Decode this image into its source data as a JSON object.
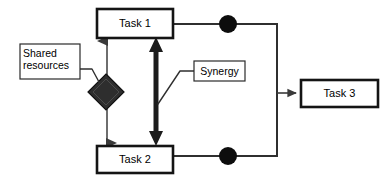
{
  "diagram": {
    "type": "block-flow-diagram",
    "canvas": {
      "width": 392,
      "height": 183,
      "background": "#ffffff"
    },
    "stroke_color": "#000000",
    "fill_color": "#ffffff",
    "shape_fill_dark": "#2b2b2b",
    "nodes": {
      "task1": {
        "label": "Task 1",
        "shape": "rectangle",
        "x": 97,
        "y": 9,
        "w": 76,
        "h": 29
      },
      "task2": {
        "label": "Task 2",
        "shape": "rectangle",
        "x": 97,
        "y": 146,
        "w": 76,
        "h": 27
      },
      "task3": {
        "label": "Task 3",
        "shape": "rectangle",
        "x": 301,
        "y": 80,
        "w": 77,
        "h": 27
      },
      "shared_resources": {
        "label": "Shared\nresources",
        "line1": "Shared",
        "line2": "resources",
        "shape": "rectangle",
        "x": 20,
        "y": 44,
        "w": 60,
        "h": 35
      },
      "synergy": {
        "label": "Synergy",
        "shape": "rectangle",
        "x": 194,
        "y": 61,
        "w": 51,
        "h": 20
      },
      "diamond": {
        "label": "",
        "shape": "diamond-filled",
        "cx": 106,
        "cy": 92,
        "rx": 18,
        "ry": 18
      },
      "junction_top": {
        "label": "",
        "shape": "circle-filled",
        "cx": 228,
        "cy": 24,
        "r": 9
      },
      "junction_bottom": {
        "label": "",
        "shape": "circle-filled",
        "cx": 228,
        "cy": 156,
        "r": 9
      }
    },
    "connectors": [
      {
        "name": "shared-resources-to-diamond",
        "style": "thin-leader"
      },
      {
        "name": "task1-to-task2-shared-arrow",
        "style": "thin-double-arrow",
        "x": 107,
        "y1": 38,
        "y2": 146
      },
      {
        "name": "task1-to-task2-synergy-arrow",
        "style": "thick-double-arrow",
        "x": 156,
        "y1": 37,
        "y2": 146
      },
      {
        "name": "synergy-to-thick-arrow",
        "style": "thin-leader"
      },
      {
        "name": "task1-to-junction-top",
        "style": "line"
      },
      {
        "name": "task2-to-junction-bottom",
        "style": "line"
      },
      {
        "name": "junction-top-to-bus",
        "style": "line"
      },
      {
        "name": "junction-bottom-to-bus",
        "style": "line"
      },
      {
        "name": "bus-to-task3",
        "style": "arrow"
      }
    ]
  }
}
